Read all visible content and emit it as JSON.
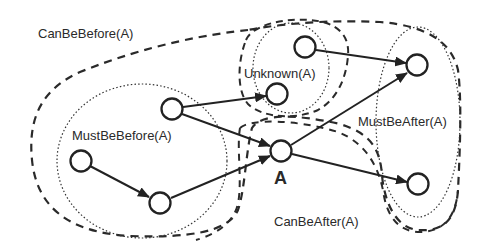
{
  "diagram": {
    "stroke_color": "#2a2a2a",
    "background": "#ffffff",
    "regions": {
      "can_be_before": {
        "label": "CanBeBefore(A)",
        "style": "dashed"
      },
      "must_be_before": {
        "label": "MustBeBefore(A)",
        "style": "dotted"
      },
      "unknown": {
        "label": "Unknown(A)",
        "style": "dotted-inner-dashed-outer"
      },
      "must_be_after": {
        "label": "MustBeAfter(A)",
        "style": "dotted"
      },
      "can_be_after": {
        "label": "CanBeAfter(A)",
        "style": "dashed"
      }
    },
    "nodes": [
      {
        "id": "n1",
        "region": "MustBeBefore(A)"
      },
      {
        "id": "n2",
        "region": "MustBeBefore(A)"
      },
      {
        "id": "n3",
        "region": "CanBeBefore(A)"
      },
      {
        "id": "n4",
        "region": "Unknown(A)"
      },
      {
        "id": "n5",
        "region": "Unknown(A)"
      },
      {
        "id": "a",
        "label": "A"
      },
      {
        "id": "n7",
        "region": "MustBeAfter(A)"
      },
      {
        "id": "n8",
        "region": "MustBeAfter(A)"
      }
    ],
    "edges": [
      {
        "from": "n1",
        "to": "n2"
      },
      {
        "from": "n2",
        "to": "a"
      },
      {
        "from": "n3",
        "to": "a"
      },
      {
        "from": "n3",
        "to": "n5"
      },
      {
        "from": "n4",
        "to": "n7"
      },
      {
        "from": "a",
        "to": "n7"
      },
      {
        "from": "a",
        "to": "n8"
      }
    ],
    "node_a_label": "A"
  }
}
